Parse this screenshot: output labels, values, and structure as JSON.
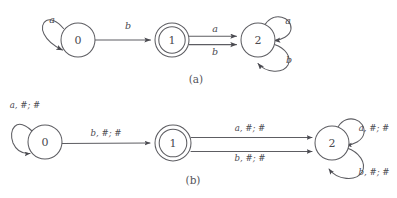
{
  "figure": {
    "background_color": "#ffffff",
    "line_color": "#5d5d62",
    "text_color": "#4a4a50"
  },
  "diagrams": [
    {
      "id": "a",
      "caption": "(a)",
      "states": [
        {
          "id": "a-state-0",
          "label": "0",
          "accepting": false,
          "cx": 78,
          "cy": 40,
          "r": 17
        },
        {
          "id": "a-state-1",
          "label": "1",
          "accepting": true,
          "cx": 172,
          "cy": 40,
          "r": 17
        },
        {
          "id": "a-state-2",
          "label": "2",
          "accepting": false,
          "cx": 258,
          "cy": 40,
          "r": 17
        }
      ],
      "transitions": [
        {
          "id": "a-loop-0",
          "from": "0",
          "to": "0",
          "label": "a",
          "kind": "self-loop",
          "side": "left",
          "lx": 52,
          "ly": 20
        },
        {
          "id": "a-edge-0-1",
          "from": "0",
          "to": "1",
          "label": "b",
          "kind": "straight",
          "lx": 128,
          "ly": 26
        },
        {
          "id": "a-edge-1-2-a",
          "from": "1",
          "to": "2",
          "label": "a",
          "kind": "straight",
          "lx": 215,
          "ly": 30
        },
        {
          "id": "a-edge-1-2-b",
          "from": "1",
          "to": "2",
          "label": "b",
          "kind": "straight",
          "lx": 215,
          "ly": 48
        },
        {
          "id": "a-loop-2-a",
          "from": "2",
          "to": "2",
          "label": "a",
          "kind": "self-loop",
          "side": "upper-right",
          "lx": 287,
          "ly": 21
        },
        {
          "id": "a-loop-2-b",
          "from": "2",
          "to": "2",
          "label": "b",
          "kind": "self-loop",
          "side": "lower-right",
          "lx": 288,
          "ly": 60
        }
      ]
    },
    {
      "id": "b",
      "caption": "(b)",
      "states": [
        {
          "id": "b-state-0",
          "label": "0",
          "accepting": false,
          "cx": 45,
          "cy": 142,
          "r": 17
        },
        {
          "id": "b-state-1",
          "label": "1",
          "accepting": true,
          "cx": 173,
          "cy": 143,
          "r": 18
        },
        {
          "id": "b-state-2",
          "label": "2",
          "accepting": false,
          "cx": 332,
          "cy": 143,
          "r": 17
        }
      ],
      "transitions": [
        {
          "id": "b-loop-0",
          "from": "0",
          "to": "0",
          "label": "a, #; #",
          "kind": "self-loop",
          "side": "left",
          "lx": 25,
          "ly": 105
        },
        {
          "id": "b-edge-0-1",
          "from": "0",
          "to": "1",
          "label": "b, #; #",
          "kind": "straight",
          "lx": 106,
          "ly": 133
        },
        {
          "id": "b-edge-1-2-a",
          "from": "1",
          "to": "2",
          "label": "a, #; #",
          "kind": "straight",
          "lx": 250,
          "ly": 127
        },
        {
          "id": "b-edge-1-2-b",
          "from": "1",
          "to": "2",
          "label": "b, #; #",
          "kind": "straight",
          "lx": 250,
          "ly": 149
        },
        {
          "id": "b-loop-2-a",
          "from": "2",
          "to": "2",
          "label": "a, #; #",
          "kind": "self-loop",
          "side": "upper-right",
          "lx": 371,
          "ly": 128
        },
        {
          "id": "b-loop-2-b",
          "from": "2",
          "to": "2",
          "label": "b, #; #",
          "kind": "self-loop",
          "side": "lower-right",
          "lx": 371,
          "ly": 170
        }
      ]
    }
  ]
}
